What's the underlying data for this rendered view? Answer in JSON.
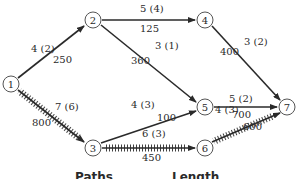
{
  "diagram": {
    "type": "network",
    "nodes": [
      {
        "id": "1",
        "label": "1",
        "x": 11,
        "y": 84
      },
      {
        "id": "2",
        "label": "2",
        "x": 93,
        "y": 20
      },
      {
        "id": "3",
        "label": "3",
        "x": 93,
        "y": 148
      },
      {
        "id": "4",
        "label": "4",
        "x": 205,
        "y": 20
      },
      {
        "id": "5",
        "label": "5",
        "x": 205,
        "y": 107
      },
      {
        "id": "6",
        "label": "6",
        "x": 205,
        "y": 148
      },
      {
        "id": "7",
        "label": "7",
        "x": 287,
        "y": 107
      }
    ],
    "edges": [
      {
        "from": "1",
        "to": "2",
        "top_label": "4 (2)",
        "bottom_label": "250",
        "critical": false
      },
      {
        "from": "1",
        "to": "3",
        "top_label": "7 (6)",
        "bottom_label": "800",
        "critical": true
      },
      {
        "from": "2",
        "to": "4",
        "top_label": "5 (4)",
        "bottom_label": "125",
        "critical": false
      },
      {
        "from": "2",
        "to": "5",
        "top_label": "3 (1)",
        "bottom_label": "360",
        "critical": false
      },
      {
        "from": "3",
        "to": "5",
        "top_label": "4 (3)",
        "bottom_label": "100",
        "critical": false
      },
      {
        "from": "3",
        "to": "6",
        "top_label": "6 (3)",
        "bottom_label": "450",
        "critical": true
      },
      {
        "from": "4",
        "to": "7",
        "top_label": "3 (2)",
        "bottom_label": "400",
        "critical": false
      },
      {
        "from": "5",
        "to": "7",
        "top_label": "5 (2)",
        "bottom_label": "700",
        "critical": false
      },
      {
        "from": "6",
        "to": "7",
        "top_label": "4 (3)",
        "bottom_label": "600",
        "critical": true
      }
    ],
    "headings": {
      "paths": "Paths",
      "length": "Length"
    }
  },
  "labels": {
    "n1": "1",
    "n2": "2",
    "n3": "3",
    "n4": "4",
    "n5": "5",
    "n6": "6",
    "n7": "7",
    "e12_t": "4 (2)",
    "e12_b": "250",
    "e13_t": "7 (6)",
    "e13_b": "800",
    "e24_t": "5 (4)",
    "e24_b": "125",
    "e25_t": "3 (1)",
    "e25_b": "360",
    "e35_t": "4 (3)",
    "e35_b": "100",
    "e36_t": "6 (3)",
    "e36_b": "450",
    "e47_t": "3 (2)",
    "e47_b": "400",
    "e57_t": "5 (2)",
    "e57_b": "700",
    "e67_t": "4 (3)",
    "e67_b": "600",
    "paths": "Paths",
    "length": "Length"
  }
}
